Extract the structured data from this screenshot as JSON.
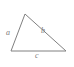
{
  "figure": {
    "type": "geometry-diagram",
    "shape": "triangle",
    "background_color": "#ffffff",
    "stroke_color": "#808080",
    "label_color": "#7a7a7a",
    "stroke_width": 1
  },
  "triangle": {
    "vertices": {
      "apex": {
        "x": 25,
        "y": 14
      },
      "bottom_left": {
        "x": 11,
        "y": 51
      },
      "bottom_right": {
        "x": 66,
        "y": 51
      }
    },
    "points_attr": "25,14 11,51 66,51"
  },
  "labels": {
    "left_side": "a",
    "right_side": "b",
    "base": "c"
  }
}
